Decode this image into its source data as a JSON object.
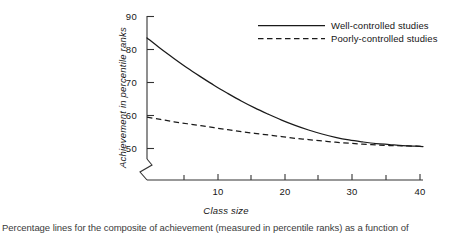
{
  "chart_data": {
    "type": "line",
    "title": "",
    "xlabel": "Class size",
    "ylabel": "Achievement in percentile ranks",
    "xlim": [
      0,
      41
    ],
    "ylim": [
      50,
      90
    ],
    "y_axis_break": true,
    "grid": false,
    "legend_position": "top-right",
    "x_ticks_major": [
      10,
      20,
      30,
      40
    ],
    "x_ticks_minor": [
      5,
      15,
      25,
      35
    ],
    "y_ticks": [
      50,
      60,
      70,
      80,
      90
    ],
    "x_tick_labels": [
      "10",
      "20",
      "30",
      "40"
    ],
    "y_tick_labels": [
      "50",
      "60",
      "70",
      "80",
      "90"
    ],
    "series": [
      {
        "name": "Well-controlled studies",
        "style": "solid",
        "color": "#1a1a1a",
        "x": [
          0,
          2,
          4,
          6,
          8,
          10,
          12,
          14,
          16,
          18,
          20,
          22,
          24,
          26,
          28,
          30,
          32,
          34,
          36,
          38,
          40,
          41
        ],
        "values": [
          83.5,
          80.3,
          77.3,
          74.4,
          71.7,
          69.1,
          66.7,
          64.4,
          62.3,
          60.4,
          58.6,
          57.0,
          55.6,
          54.4,
          53.4,
          52.6,
          52.0,
          51.5,
          51.2,
          50.9,
          50.7,
          50.6
        ]
      },
      {
        "name": "Poorly-controlled studies",
        "style": "dashed",
        "color": "#1a1a1a",
        "x": [
          0,
          2,
          4,
          6,
          8,
          10,
          12,
          14,
          16,
          18,
          20,
          22,
          24,
          26,
          28,
          30,
          32,
          34,
          36,
          38,
          40,
          41
        ],
        "values": [
          59.5,
          58.8,
          58.1,
          57.5,
          56.9,
          56.3,
          55.7,
          55.1,
          54.6,
          54.1,
          53.6,
          53.1,
          52.7,
          52.3,
          51.9,
          51.6,
          51.3,
          51.1,
          50.9,
          50.8,
          50.7,
          50.6
        ]
      }
    ]
  },
  "legend": {
    "items": [
      {
        "label": "Well-controlled studies",
        "style": "solid"
      },
      {
        "label": "Poorly-controlled studies",
        "style": "dashed"
      }
    ]
  },
  "axes": {
    "y_title": "Achievement in percentile ranks",
    "x_title": "Class size",
    "y_labels": [
      "90",
      "80",
      "70",
      "60",
      "50"
    ],
    "x_labels": [
      "10",
      "20",
      "30",
      "40"
    ]
  },
  "caption": {
    "text": "Percentage lines for the composite of achievement (measured in percentile ranks) as a function of"
  }
}
